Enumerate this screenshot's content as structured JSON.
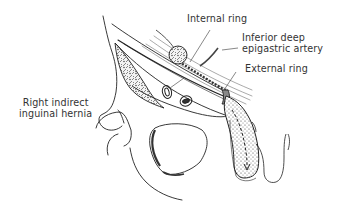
{
  "figure": {
    "type": "anatomical-illustration",
    "subject": "Right indirect inguinal hernia",
    "colors": {
      "background": "#ffffff",
      "ink": "#222222",
      "label_text": "#333333",
      "stipple": "#555555"
    }
  },
  "labels": [
    {
      "id": "internal-ring",
      "text": "Internal ring"
    },
    {
      "id": "inferior-deep-epigastric-artery",
      "line1": "Inferior deep",
      "line2": "epigastric artery"
    },
    {
      "id": "external-ring",
      "text": "External ring"
    },
    {
      "id": "right-indirect-inguinal-hernia",
      "line1": "Right indirect",
      "line2": "inguinal hernia"
    }
  ]
}
